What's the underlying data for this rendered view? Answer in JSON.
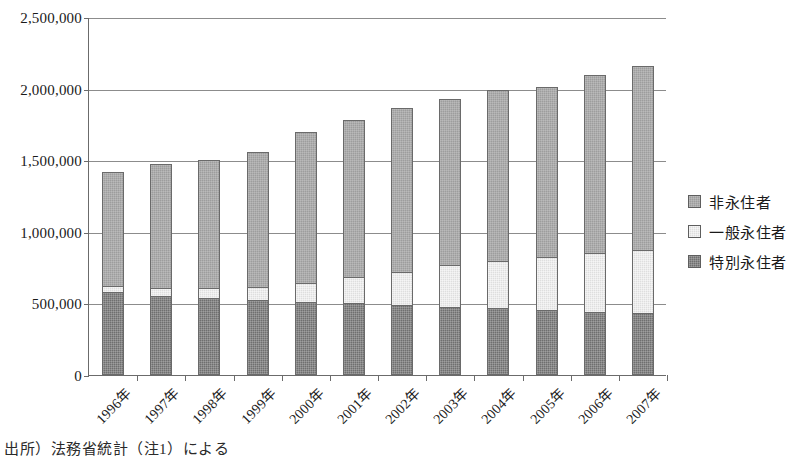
{
  "chart_data": {
    "type": "bar",
    "stacked": true,
    "title": "",
    "xlabel": "",
    "ylabel": "",
    "ylim": [
      0,
      2500000
    ],
    "ytick_values": [
      0,
      500000,
      1000000,
      1500000,
      2000000,
      2500000
    ],
    "ytick_labels": [
      "0",
      "500,000",
      "1,000,000",
      "1,500,000",
      "2,000,000",
      "2,500,000"
    ],
    "grid": true,
    "legend_position": "right",
    "categories": [
      "1996年",
      "1997年",
      "1998年",
      "1999年",
      "2000年",
      "2001年",
      "2002年",
      "2003年",
      "2004年",
      "2005年",
      "2006年",
      "2007年"
    ],
    "series": [
      {
        "name": "特別永住者",
        "color": "#6f6f6f",
        "values": [
          578000,
          551000,
          537000,
          523000,
          513000,
          500000,
          489000,
          475000,
          466000,
          452000,
          443000,
          431000
        ]
      },
      {
        "name": "一般永住者",
        "color": "#dedede",
        "values": [
          42000,
          60000,
          74000,
          92000,
          132000,
          185000,
          232000,
          293000,
          327000,
          370000,
          411000,
          440000
        ]
      },
      {
        "name": "非永住者",
        "color": "#9d9d9d",
        "values": [
          796000,
          864000,
          893000,
          940000,
          1050000,
          1098000,
          1146000,
          1162000,
          1197000,
          1188000,
          1238000,
          1289000
        ]
      }
    ],
    "totals": [
      1416000,
      1475000,
      1504000,
      1555000,
      1695000,
      1783000,
      1867000,
      1930000,
      1990000,
      2010000,
      2092000,
      2160000
    ]
  },
  "legend": {
    "items": [
      {
        "label": "非永住者",
        "swatch": "#9d9d9d",
        "pattern": "checkered-medium"
      },
      {
        "label": "一般永住者",
        "swatch": "#dedede",
        "pattern": "checkered-light"
      },
      {
        "label": "特別永住者",
        "swatch": "#6f6f6f",
        "pattern": "checkered-dark"
      }
    ]
  },
  "caption": {
    "text": "出所）法務省統計（注1）による"
  },
  "colors": {
    "axis": "#6b6b6b",
    "grid": "#8c8c8c",
    "background": "#ffffff",
    "text": "#1a1a1a"
  }
}
